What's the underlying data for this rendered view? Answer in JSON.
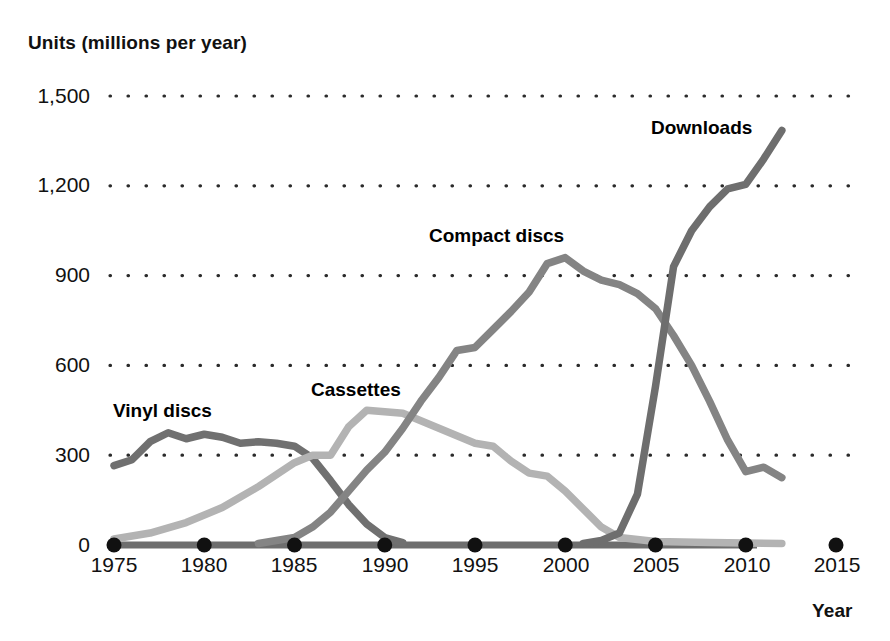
{
  "chart_data": {
    "type": "line",
    "title": "",
    "xlabel": "Year",
    "ylabel": "Units (millions per year)",
    "xlim": [
      1975,
      2015
    ],
    "ylim": [
      0,
      1500
    ],
    "grid": true,
    "grid_style": "dotted horizontal",
    "legend": "inline series labels",
    "x_ticks": [
      "1975",
      "1980",
      "1985",
      "1990",
      "1995",
      "2000",
      "2005",
      "2010",
      "2015"
    ],
    "y_ticks": [
      "0",
      "300",
      "600",
      "900",
      "1,200",
      "1,500"
    ],
    "series": [
      {
        "name": "Vinyl discs",
        "color": "#707070",
        "x": [
          1975,
          1976,
          1977,
          1978,
          1979,
          1980,
          1981,
          1982,
          1983,
          1984,
          1985,
          1986,
          1987,
          1988,
          1989,
          1990,
          1991
        ],
        "values": [
          265,
          285,
          345,
          375,
          355,
          370,
          360,
          340,
          345,
          340,
          330,
          290,
          215,
          135,
          70,
          25,
          8
        ]
      },
      {
        "name": "Cassettes",
        "color": "#b3b3b3",
        "x": [
          1975,
          1977,
          1979,
          1981,
          1983,
          1985,
          1986,
          1987,
          1988,
          1989,
          1990,
          1991,
          1993,
          1995,
          1996,
          1997,
          1998,
          1999,
          2000,
          2001,
          2002,
          2003,
          2005,
          2008,
          2012
        ],
        "values": [
          20,
          40,
          75,
          125,
          195,
          275,
          300,
          300,
          395,
          450,
          445,
          440,
          390,
          340,
          330,
          280,
          240,
          230,
          180,
          120,
          60,
          25,
          12,
          8,
          5
        ]
      },
      {
        "name": "Compact discs",
        "color": "#848484",
        "x": [
          1983,
          1985,
          1986,
          1987,
          1988,
          1989,
          1990,
          1991,
          1992,
          1993,
          1994,
          1995,
          1996,
          1997,
          1998,
          1999,
          2000,
          2001,
          2002,
          2003,
          2004,
          2005,
          2006,
          2007,
          2008,
          2009,
          2010,
          2011,
          2012
        ],
        "values": [
          5,
          25,
          60,
          110,
          180,
          250,
          310,
          390,
          480,
          560,
          650,
          660,
          720,
          780,
          845,
          940,
          960,
          915,
          885,
          870,
          840,
          790,
          700,
          600,
          480,
          350,
          245,
          260,
          225
        ]
      },
      {
        "name": "Downloads",
        "color": "#6e6e6e",
        "x": [
          2001,
          2002,
          2003,
          2004,
          2005,
          2006,
          2007,
          2008,
          2009,
          2010,
          2011,
          2012
        ],
        "values": [
          5,
          15,
          40,
          170,
          530,
          930,
          1050,
          1130,
          1190,
          1205,
          1290,
          1385
        ]
      }
    ]
  },
  "style": {
    "axis_color": "#111111",
    "grid_color": "#2b2b2b",
    "baseline_color": "#6e6e6e",
    "marker_color": "#111111",
    "background": "#ffffff"
  }
}
